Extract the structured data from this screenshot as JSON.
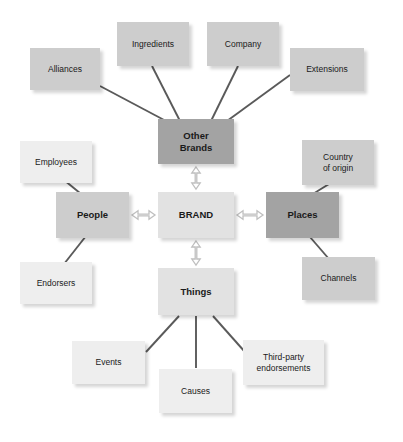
{
  "diagram": {
    "type": "concept-map",
    "background_color": "#ffffff",
    "connector_color": "#5a5a5a",
    "arrow_color": "#bfbfbf",
    "center": {
      "id": "brand",
      "label": "BRAND",
      "tone": "light",
      "color": "#e2e2e2",
      "x": 158,
      "y": 192,
      "w": 76,
      "h": 46,
      "bold": true,
      "font_size": 9.5
    },
    "hubs": [
      {
        "id": "other-brands",
        "label": "Other\nBrands",
        "tone": "dark",
        "color": "#a3a3a3",
        "x": 158,
        "y": 119,
        "w": 76,
        "h": 45,
        "bold": true,
        "font_size": 9.5
      },
      {
        "id": "people",
        "label": "People",
        "tone": "mid",
        "color": "#cdcdcd",
        "x": 56,
        "y": 192,
        "w": 73,
        "h": 46,
        "bold": true,
        "font_size": 9.5
      },
      {
        "id": "places",
        "label": "Places",
        "tone": "dark",
        "color": "#a3a3a3",
        "x": 266,
        "y": 192,
        "w": 73,
        "h": 46,
        "bold": true,
        "font_size": 9.5
      },
      {
        "id": "things",
        "label": "Things",
        "tone": "light",
        "color": "#e2e2e2",
        "x": 158,
        "y": 268,
        "w": 76,
        "h": 47,
        "bold": true,
        "font_size": 9.5
      }
    ],
    "leaves": [
      {
        "id": "alliances",
        "label": "Alliances",
        "parent": "other-brands",
        "tone": "mid",
        "color": "#cdcdcd",
        "x": 30,
        "y": 48,
        "w": 70,
        "h": 42,
        "font_size": 8.5
      },
      {
        "id": "ingredients",
        "label": "Ingredients",
        "parent": "other-brands",
        "tone": "mid",
        "color": "#cdcdcd",
        "x": 117,
        "y": 22,
        "w": 72,
        "h": 44,
        "font_size": 8.5
      },
      {
        "id": "company",
        "label": "Company",
        "parent": "other-brands",
        "tone": "mid",
        "color": "#cdcdcd",
        "x": 207,
        "y": 22,
        "w": 72,
        "h": 44,
        "font_size": 8.5
      },
      {
        "id": "extensions",
        "label": "Extensions",
        "parent": "other-brands",
        "tone": "mid",
        "color": "#cdcdcd",
        "x": 290,
        "y": 48,
        "w": 74,
        "h": 43,
        "font_size": 8.5
      },
      {
        "id": "employees",
        "label": "Employees",
        "parent": "people",
        "tone": "vlight",
        "color": "#eeeeee",
        "x": 20,
        "y": 141,
        "w": 72,
        "h": 42,
        "font_size": 8.5
      },
      {
        "id": "endorsers",
        "label": "Endorsers",
        "parent": "people",
        "tone": "vlight",
        "color": "#eeeeee",
        "x": 20,
        "y": 262,
        "w": 72,
        "h": 42,
        "font_size": 8.5
      },
      {
        "id": "country-of-origin",
        "label": "Country\nof origin",
        "parent": "places",
        "tone": "mid",
        "color": "#cdcdcd",
        "x": 302,
        "y": 140,
        "w": 72,
        "h": 45,
        "font_size": 8.5
      },
      {
        "id": "channels",
        "label": "Channels",
        "parent": "places",
        "tone": "mid",
        "color": "#cdcdcd",
        "x": 302,
        "y": 257,
        "w": 73,
        "h": 43,
        "font_size": 8.5
      },
      {
        "id": "events",
        "label": "Events",
        "parent": "things",
        "tone": "vlight",
        "color": "#eeeeee",
        "x": 72,
        "y": 341,
        "w": 73,
        "h": 43,
        "font_size": 8.5
      },
      {
        "id": "causes",
        "label": "Causes",
        "parent": "things",
        "tone": "vlight",
        "color": "#eeeeee",
        "x": 159,
        "y": 369,
        "w": 73,
        "h": 44,
        "font_size": 8.5
      },
      {
        "id": "third-party-endorsements",
        "label": "Third-party\nendorsements",
        "parent": "things",
        "tone": "vlight",
        "color": "#eeeeee",
        "x": 243,
        "y": 340,
        "w": 81,
        "h": 45,
        "font_size": 8.5
      }
    ],
    "connectors": [
      {
        "from": "alliances",
        "to": "other-brands",
        "x1": 100,
        "y1": 86,
        "x2": 166,
        "y2": 121
      },
      {
        "from": "ingredients",
        "to": "other-brands",
        "x1": 152,
        "y1": 66,
        "x2": 180,
        "y2": 121
      },
      {
        "from": "company",
        "to": "other-brands",
        "x1": 238,
        "y1": 66,
        "x2": 211,
        "y2": 121
      },
      {
        "from": "extensions",
        "to": "other-brands",
        "x1": 290,
        "y1": 75,
        "x2": 227,
        "y2": 121
      },
      {
        "from": "employees",
        "to": "people",
        "x1": 64,
        "y1": 180,
        "x2": 86,
        "y2": 198
      },
      {
        "from": "endorsers",
        "to": "people",
        "x1": 64,
        "y1": 264,
        "x2": 86,
        "y2": 236
      },
      {
        "from": "country-of-origin",
        "to": "places",
        "x1": 329,
        "y1": 184,
        "x2": 308,
        "y2": 197
      },
      {
        "from": "channels",
        "to": "places",
        "x1": 329,
        "y1": 259,
        "x2": 310,
        "y2": 237
      },
      {
        "from": "events",
        "to": "things",
        "x1": 146,
        "y1": 352,
        "x2": 179,
        "y2": 316
      },
      {
        "from": "causes",
        "to": "things",
        "x1": 196,
        "y1": 368,
        "x2": 196,
        "y2": 316
      },
      {
        "from": "third-party-endorsements",
        "to": "things",
        "x1": 245,
        "y1": 352,
        "x2": 213,
        "y2": 316
      }
    ],
    "arrows": [
      {
        "id": "arrow-brand-other-brands",
        "orientation": "vertical",
        "x": 196,
        "y1": 167,
        "y2": 189
      },
      {
        "id": "arrow-brand-things",
        "orientation": "vertical",
        "x": 196,
        "y1": 241,
        "y2": 265
      },
      {
        "id": "arrow-brand-people",
        "orientation": "horizontal",
        "y": 215,
        "x1": 132,
        "x2": 155
      },
      {
        "id": "arrow-brand-places",
        "orientation": "horizontal",
        "y": 215,
        "x1": 237,
        "x2": 263
      }
    ]
  }
}
